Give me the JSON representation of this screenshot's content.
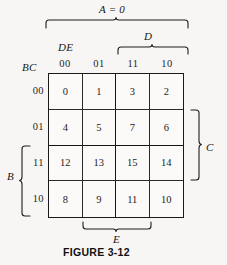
{
  "figure": {
    "caption": "FIGURE 3-12",
    "title_label": "A = 0"
  },
  "kmap": {
    "column_variable_label": "DE",
    "row_variable_label": "BC",
    "column_headers": [
      "00",
      "01",
      "11",
      "10"
    ],
    "row_headers": [
      "00",
      "01",
      "11",
      "10"
    ],
    "cells": [
      [
        "0",
        "1",
        "3",
        "2"
      ],
      [
        "4",
        "5",
        "7",
        "6"
      ],
      [
        "12",
        "13",
        "15",
        "14"
      ],
      [
        "8",
        "9",
        "11",
        "10"
      ]
    ]
  },
  "brackets": {
    "top_outer": {
      "label": "A = 0",
      "spans": "all four columns"
    },
    "top_inner": {
      "label": "D",
      "spans": "columns 11 and 10"
    },
    "right": {
      "label": "C",
      "spans": "rows 01 and 11"
    },
    "left": {
      "label": "B",
      "spans": "rows 11 and 10"
    },
    "bottom": {
      "label": "E",
      "spans": "columns 01 and 11"
    }
  },
  "colors": {
    "background": "#f7f6f4",
    "grid_line": "#1b1b1b",
    "text": "#1a1a1a"
  }
}
